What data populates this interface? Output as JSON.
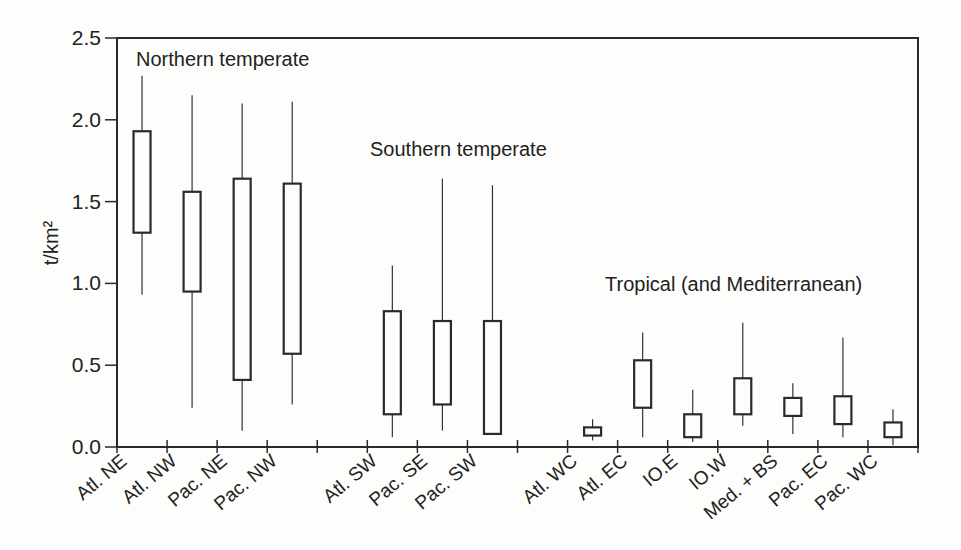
{
  "chart_data": {
    "type": "boxplot",
    "title": "",
    "xlabel": "",
    "ylabel": "t/km²",
    "ylim": [
      0,
      2.5
    ],
    "yticks": [
      "0.0",
      "0.5",
      "1.0",
      "1.5",
      "2.0",
      "2.5"
    ],
    "grid": false,
    "legend": null,
    "region_annotations": [
      {
        "text": "Northern temperate",
        "x_px": 136,
        "y_px": 66
      },
      {
        "text": "Southern temperate",
        "x_px": 370,
        "y_px": 156
      },
      {
        "text": "Tropical (and Mediterranean)",
        "x_px": 605,
        "y_px": 291
      }
    ],
    "slots": 16,
    "categories": [
      "Atl. NE",
      "Atl. NW",
      "Pac. NE",
      "Pac. NW",
      "",
      "Atl. SW",
      "Pac. SE",
      "Pac. SW",
      "",
      "Atl. WC",
      "Atl. EC",
      "IO.E",
      "IO.W",
      "Med. + BS",
      "Pac. EC",
      "Pac. WC"
    ],
    "series": [
      {
        "name": "Atl. NE",
        "group": "Northern temperate",
        "slot": 0,
        "whisker_low": 0.93,
        "q1": 1.31,
        "q3": 1.93,
        "whisker_high": 2.27
      },
      {
        "name": "Atl. NW",
        "group": "Northern temperate",
        "slot": 1,
        "whisker_low": 0.24,
        "q1": 0.95,
        "q3": 1.56,
        "whisker_high": 2.15
      },
      {
        "name": "Pac. NE",
        "group": "Northern temperate",
        "slot": 2,
        "whisker_low": 0.1,
        "q1": 0.41,
        "q3": 1.64,
        "whisker_high": 2.1
      },
      {
        "name": "Pac. NW",
        "group": "Northern temperate",
        "slot": 3,
        "whisker_low": 0.26,
        "q1": 0.57,
        "q3": 1.61,
        "whisker_high": 2.11
      },
      {
        "name": "Atl. SW",
        "group": "Southern temperate",
        "slot": 5,
        "whisker_low": 0.06,
        "q1": 0.2,
        "q3": 0.83,
        "whisker_high": 1.11
      },
      {
        "name": "Pac. SE",
        "group": "Southern temperate",
        "slot": 6,
        "whisker_low": 0.1,
        "q1": 0.26,
        "q3": 0.77,
        "whisker_high": 1.64
      },
      {
        "name": "Pac. SW",
        "group": "Southern temperate",
        "slot": 7,
        "whisker_low": 0.08,
        "q1": 0.08,
        "q3": 0.77,
        "whisker_high": 1.6
      },
      {
        "name": "Atl. WC",
        "group": "Tropical (and Mediterranean)",
        "slot": 9,
        "whisker_low": 0.04,
        "q1": 0.07,
        "q3": 0.12,
        "whisker_high": 0.17
      },
      {
        "name": "Atl. EC",
        "group": "Tropical (and Mediterranean)",
        "slot": 10,
        "whisker_low": 0.06,
        "q1": 0.24,
        "q3": 0.53,
        "whisker_high": 0.7
      },
      {
        "name": "IO.E",
        "group": "Tropical (and Mediterranean)",
        "slot": 11,
        "whisker_low": 0.03,
        "q1": 0.06,
        "q3": 0.2,
        "whisker_high": 0.35
      },
      {
        "name": "IO.W",
        "group": "Tropical (and Mediterranean)",
        "slot": 12,
        "whisker_low": 0.13,
        "q1": 0.2,
        "q3": 0.42,
        "whisker_high": 0.76
      },
      {
        "name": "Med. + BS",
        "group": "Tropical (and Mediterranean)",
        "slot": 13,
        "whisker_low": 0.08,
        "q1": 0.19,
        "q3": 0.3,
        "whisker_high": 0.39
      },
      {
        "name": "Pac. EC",
        "group": "Tropical (and Mediterranean)",
        "slot": 14,
        "whisker_low": 0.06,
        "q1": 0.14,
        "q3": 0.31,
        "whisker_high": 0.67
      },
      {
        "name": "Pac. WC",
        "group": "Tropical (and Mediterranean)",
        "slot": 15,
        "whisker_low": 0.01,
        "q1": 0.06,
        "q3": 0.15,
        "whisker_high": 0.23
      }
    ]
  },
  "layout": {
    "plot_left": 117,
    "plot_right": 918,
    "plot_top": 38,
    "plot_bottom": 447
  }
}
